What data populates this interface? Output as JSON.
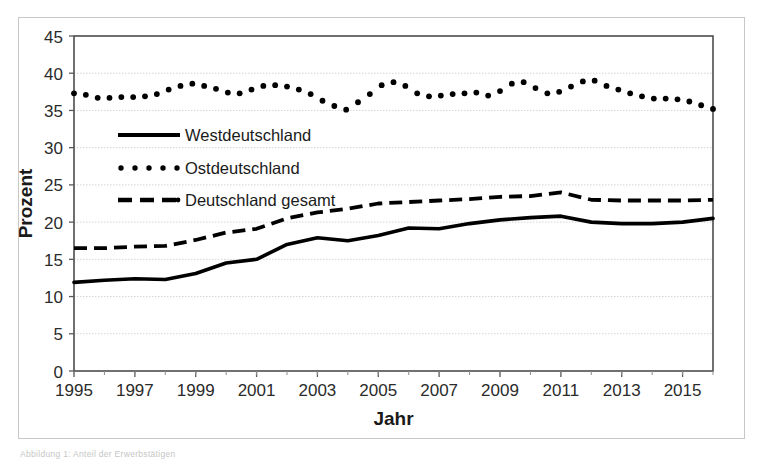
{
  "figure": {
    "caption": "Abbildung 1: Anteil der Erwerbstätigen"
  },
  "chart_data": {
    "type": "line",
    "title": "",
    "xlabel": "Jahr",
    "ylabel": "Prozent",
    "xlim": [
      1995,
      2016
    ],
    "ylim": [
      0,
      45
    ],
    "ytick_step": 5,
    "yticks": [
      0,
      5,
      10,
      15,
      20,
      25,
      30,
      35,
      40,
      45
    ],
    "xticks": [
      1995,
      1997,
      1999,
      2001,
      2003,
      2005,
      2007,
      2009,
      2011,
      2013,
      2015
    ],
    "xtick_labels": [
      "1995",
      "1997",
      "1999",
      "2001",
      "2003",
      "2005",
      "2007",
      "2009",
      "2011",
      "2013",
      "2015"
    ],
    "grid": true,
    "grid_axis": "y",
    "legend_position": "upper left inside",
    "x": [
      1995,
      1996,
      1997,
      1998,
      1999,
      2000,
      2001,
      2002,
      2003,
      2004,
      2005,
      2006,
      2007,
      2008,
      2009,
      2010,
      2011,
      2012,
      2013,
      2014,
      2015,
      2016
    ],
    "series": [
      {
        "name": "Westdeutschland",
        "style": "solid",
        "color": "#000000",
        "values": [
          11.9,
          12.2,
          12.4,
          12.3,
          13.1,
          14.5,
          15.0,
          17.0,
          17.9,
          17.5,
          18.2,
          19.2,
          19.1,
          19.8,
          20.3,
          20.6,
          20.8,
          20.0,
          19.8,
          19.8,
          20.0,
          20.5
        ]
      },
      {
        "name": "Ostdeutschland",
        "style": "dotted",
        "color": "#000000",
        "values": [
          37.3,
          37.0,
          36.7,
          36.8,
          37.0,
          38.2,
          38.6,
          37.7,
          37.4,
          37.1,
          38.3,
          38.4,
          38.0,
          37.1,
          36.0,
          35.1,
          36.0,
          38.8,
          39.0,
          37.4,
          37.0,
          37.2
        ]
      },
      {
        "name": "Deutschland gesamt",
        "style": "dashed",
        "color": "#000000",
        "values": [
          16.5,
          16.5,
          16.7,
          16.8,
          17.6,
          18.6,
          19.1,
          20.5,
          21.3,
          21.8,
          22.5,
          22.7,
          22.9,
          23.1,
          23.4,
          23.5,
          24.0,
          23.0,
          22.9,
          22.9,
          22.9,
          23.0
        ]
      }
    ],
    "ostdeutschland_detail": [
      37.3,
      37.1,
      36.7,
      36.7,
      36.8,
      36.8,
      36.9,
      37.2,
      37.8,
      38.3,
      38.6,
      38.3,
      37.9,
      37.4,
      37.3,
      37.8,
      38.3,
      38.4,
      38.2,
      37.8,
      37.2,
      36.3,
      35.6,
      35.1,
      36.1,
      37.2,
      38.4,
      38.8,
      38.3,
      37.3,
      36.9,
      37.0,
      37.2,
      37.3,
      37.4,
      37.0,
      37.6,
      38.6,
      38.8,
      38.0,
      37.3,
      37.5,
      38.2,
      38.9,
      39.0,
      38.3,
      37.8,
      37.3,
      36.9,
      36.6,
      36.6,
      36.5,
      36.2,
      35.7,
      35.2
    ]
  },
  "legend": {
    "items": [
      {
        "label": "Westdeutschland",
        "style": "solid"
      },
      {
        "label": "Ostdeutschland",
        "style": "dotted"
      },
      {
        "label": "Deutschland gesamt",
        "style": "dashed"
      }
    ]
  }
}
